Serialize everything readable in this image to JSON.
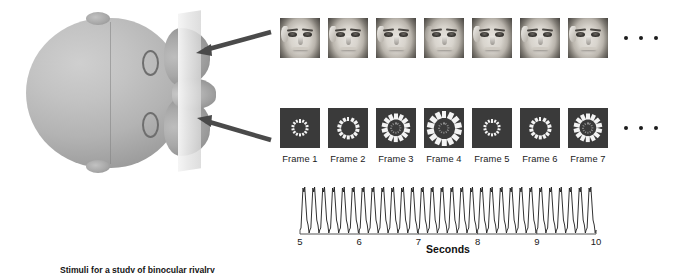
{
  "figure": {
    "caption": "Stimuli for a study of binocular rivalry"
  },
  "head": {
    "label": "participant-head-top-view",
    "screen_label": "display-screen-plane",
    "skull_color": "#b3b3b3",
    "ear_label": "ear"
  },
  "arrows": [
    {
      "name": "upper-stimulus-arrow",
      "color": "#4a4a4a"
    },
    {
      "name": "lower-stimulus-arrow",
      "color": "#4a4a4a"
    }
  ],
  "face_row": {
    "name": "face-stimulus-sequence",
    "frames": [
      {
        "index": 1,
        "hair": true
      },
      {
        "index": 2,
        "hair": true
      },
      {
        "index": 3,
        "hair": true
      },
      {
        "index": 4,
        "hair": false
      },
      {
        "index": 5,
        "hair": true
      },
      {
        "index": 6,
        "hair": true
      },
      {
        "index": 7,
        "hair": true
      }
    ],
    "ellipsis": "• • •"
  },
  "ring_row": {
    "name": "ring-flicker-stimulus-sequence",
    "labels": [
      "Frame 1",
      "Frame 2",
      "Frame 3",
      "Frame 4",
      "Frame 5",
      "Frame 6",
      "Frame 7"
    ],
    "frames": [
      {
        "label": "Frame 1",
        "radius": 7.0,
        "seg_len": 3.4,
        "seg_w": 2.0,
        "segments": 14,
        "inner": false
      },
      {
        "label": "Frame 2",
        "radius": 9.0,
        "seg_len": 4.4,
        "seg_w": 2.8,
        "segments": 14,
        "inner": false
      },
      {
        "label": "Frame 3",
        "radius": 11.5,
        "seg_len": 5.6,
        "seg_w": 3.8,
        "segments": 14,
        "inner": true
      },
      {
        "label": "Frame 4",
        "radius": 14.0,
        "seg_len": 7.0,
        "seg_w": 4.8,
        "segments": 14,
        "inner": true
      },
      {
        "label": "Frame 5",
        "radius": 7.0,
        "seg_len": 3.4,
        "seg_w": 2.0,
        "segments": 14,
        "inner": false
      },
      {
        "label": "Frame 6",
        "radius": 9.0,
        "seg_len": 4.4,
        "seg_w": 2.8,
        "segments": 14,
        "inner": false
      },
      {
        "label": "Frame 7",
        "radius": 11.5,
        "seg_len": 5.6,
        "seg_w": 3.8,
        "segments": 14,
        "inner": true
      }
    ],
    "ellipsis": "• • •"
  },
  "chart_data": {
    "type": "line",
    "title": "",
    "xlabel": "Seconds",
    "ylabel": "",
    "xlim": [
      5,
      10
    ],
    "ylim": [
      0,
      1
    ],
    "grid": false,
    "legend": null,
    "tick_labels": [
      "5",
      "6",
      "7",
      "8",
      "9",
      "10"
    ],
    "ticks": [
      5,
      6,
      7,
      8,
      9,
      10
    ],
    "series": [
      {
        "name": "steady-state visual evoked response",
        "waveform": "sawtooth",
        "cycles_per_second": 6,
        "total_cycles": 30,
        "color": "#1b1b1b",
        "line_width": 0.9
      }
    ]
  }
}
